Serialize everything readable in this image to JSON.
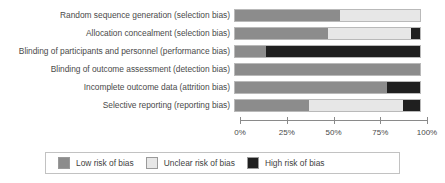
{
  "chart_data": {
    "type": "bar",
    "orientation": "horizontal",
    "stacked": true,
    "normalized_percent": true,
    "title": "",
    "subtitle": "",
    "xlabel": "",
    "ylabel": "",
    "xlim": [
      0,
      100
    ],
    "xticks": [
      "0%",
      "25%",
      "50%",
      "75%",
      "100%"
    ],
    "xtick_values": [
      0,
      25,
      50,
      75,
      100
    ],
    "grid": false,
    "legend_position": "bottom",
    "categories": [
      "Random sequence generation (selection bias)",
      "Allocation concealment (selection bias)",
      "Blinding of participants and personnel (performance bias)",
      "Blinding of outcome assessment (detection bias)",
      "Incomplete outcome data (attrition bias)",
      "Selective reporting (reporting bias)"
    ],
    "series": [
      {
        "name": "Low risk of bias",
        "color": "#8c8c8c",
        "values": [
          57,
          50,
          17,
          100,
          82,
          40
        ]
      },
      {
        "name": "Unclear risk of bias",
        "color": "#e7e7e7",
        "values": [
          43,
          45,
          0,
          0,
          0,
          51
        ]
      },
      {
        "name": "High risk of bias",
        "color": "#1f1f1f",
        "values": [
          0,
          5,
          83,
          0,
          18,
          9
        ]
      }
    ]
  },
  "legend": {
    "items": [
      {
        "label": "Low risk of bias",
        "color": "#8c8c8c"
      },
      {
        "label": "Unclear risk of bias",
        "color": "#e7e7e7"
      },
      {
        "label": "High risk of bias",
        "color": "#1f1f1f"
      }
    ]
  }
}
